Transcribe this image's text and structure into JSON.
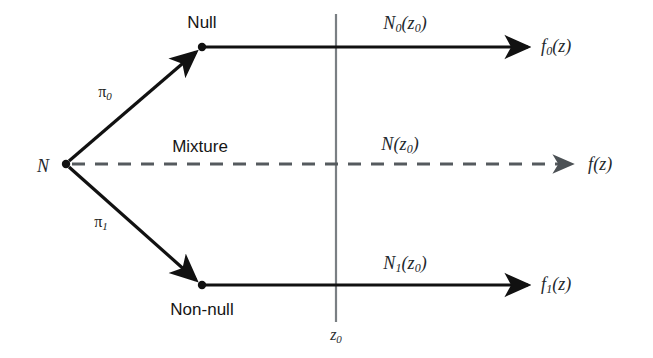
{
  "figure": {
    "type": "flow-diagram",
    "background_color": "#ffffff",
    "stroke_color": "#111111",
    "dashed_stroke_color": "#555a5e",
    "axis_line_color": "#7a7f83"
  },
  "nodes": {
    "source": {
      "label": "N",
      "x": 43,
      "y": 166
    },
    "null_branch": {
      "label": "Null",
      "x": 202,
      "y": 22
    },
    "nonnull_branch": {
      "label": "Non-null",
      "x": 202,
      "y": 309
    },
    "mixture_branch": {
      "label": "Mixture",
      "x": 200,
      "y": 146
    }
  },
  "edge_labels": {
    "pi_null": {
      "base": "π",
      "sub": "0",
      "x": 105,
      "y": 93
    },
    "pi_nonnull": {
      "base": "π",
      "sub": "1",
      "x": 101,
      "y": 223
    }
  },
  "counts": {
    "null_count": {
      "base": "N",
      "sub": "0",
      "arg": "(z",
      "argsub": "0",
      "argend": ")",
      "x": 405,
      "y": 24
    },
    "mixture_count": {
      "base": "N",
      "sub": "",
      "arg": "(z",
      "argsub": "0",
      "argend": ")",
      "x": 400,
      "y": 145
    },
    "nonnull_count": {
      "base": "N",
      "sub": "1",
      "arg": "(z",
      "argsub": "0",
      "argend": ")",
      "x": 405,
      "y": 264
    }
  },
  "outputs": {
    "f_null": {
      "base": "f",
      "sub": "0",
      "arg": "(z)",
      "x": 541,
      "y": 47
    },
    "f_mixture": {
      "base": "f",
      "sub": "",
      "arg": "(z)",
      "x": 588,
      "y": 165
    },
    "f_nonnull": {
      "base": "f",
      "sub": "1",
      "arg": "(z)",
      "x": 541,
      "y": 285
    }
  },
  "axis": {
    "threshold_label": {
      "base": "z",
      "sub": "0",
      "x": 336,
      "y": 336
    },
    "line_x": 336,
    "line_top_y": 14,
    "line_bottom_y": 322
  },
  "geometry": {
    "source_point": {
      "x": 66,
      "y": 164
    },
    "null_point": {
      "x": 202,
      "y": 47
    },
    "nonnull_point": {
      "x": 202,
      "y": 285
    },
    "top_arrow_end_x": 532,
    "mid_arrow_end_x": 578,
    "bottom_arrow_end_x": 532
  }
}
